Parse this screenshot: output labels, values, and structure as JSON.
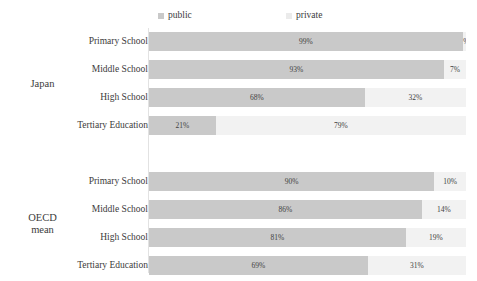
{
  "chart_data": {
    "type": "bar",
    "title": "",
    "subtitle": "",
    "xlabel": "",
    "ylabel": "",
    "orientation": "horizontal",
    "stacked": true,
    "normalized_percent": true,
    "xlim": [
      0,
      100
    ],
    "grid": false,
    "legend_position": "top",
    "legend": [
      "public",
      "private"
    ],
    "colors": {
      "public": "#c9c9c9",
      "private": "#f2f2f2",
      "legend_private_swatch": "#ebebeb",
      "axis_line": "#e2e2e2",
      "text": "#3b3b3b"
    },
    "groups": [
      {
        "name": "Japan",
        "categories": [
          "Primary School",
          "Middle School",
          "High School",
          "Tertiary Education"
        ],
        "series": [
          {
            "name": "public",
            "values": [
              99,
              93,
              68,
              21
            ]
          },
          {
            "name": "private",
            "values": [
              1,
              7,
              32,
              79
            ]
          }
        ]
      },
      {
        "name": "OECD mean",
        "categories": [
          "Primary School",
          "Middle School",
          "High School",
          "Tertiary Education"
        ],
        "series": [
          {
            "name": "public",
            "values": [
              90,
              86,
              81,
              69
            ]
          },
          {
            "name": "private",
            "values": [
              10,
              14,
              19,
              31
            ]
          }
        ]
      }
    ]
  },
  "legend": {
    "public": "public",
    "private": "private"
  },
  "groups": [
    {
      "label_line1": "Japan",
      "label_line2": "",
      "rows": [
        {
          "category": "Primary School",
          "public": "99%",
          "private": "1%",
          "public_pct": 99,
          "private_pct": 1
        },
        {
          "category": "Middle School",
          "public": "93%",
          "private": "7%",
          "public_pct": 93,
          "private_pct": 7
        },
        {
          "category": "High School",
          "public": "68%",
          "private": "32%",
          "public_pct": 68,
          "private_pct": 32
        },
        {
          "category": "Tertiary Education",
          "public": "21%",
          "private": "79%",
          "public_pct": 21,
          "private_pct": 79
        }
      ]
    },
    {
      "label_line1": "OECD",
      "label_line2": "mean",
      "rows": [
        {
          "category": "Primary School",
          "public": "90%",
          "private": "10%",
          "public_pct": 90,
          "private_pct": 10
        },
        {
          "category": "Middle School",
          "public": "86%",
          "private": "14%",
          "public_pct": 86,
          "private_pct": 14
        },
        {
          "category": "High School",
          "public": "81%",
          "private": "19%",
          "public_pct": 81,
          "private_pct": 19
        },
        {
          "category": "Tertiary Education",
          "public": "69%",
          "private": "31%",
          "public_pct": 69,
          "private_pct": 31
        }
      ]
    }
  ]
}
